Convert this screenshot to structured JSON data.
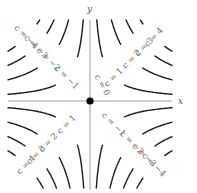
{
  "chart_data": {
    "type": "contour",
    "title": "",
    "function": "c = x*y",
    "xlabel": "x",
    "ylabel": "y",
    "origin_marker": true,
    "levels": [
      {
        "quadrant": "upper-right",
        "values": [
          0,
          1,
          2,
          3,
          4
        ]
      },
      {
        "quadrant": "upper-left",
        "values": [
          -1,
          -2,
          -3,
          -4
        ]
      },
      {
        "quadrant": "lower-left",
        "values": [
          1,
          2,
          3,
          4
        ]
      },
      {
        "quadrant": "lower-right",
        "values": [
          -1,
          -2,
          -3,
          -4
        ]
      }
    ],
    "labels": {
      "upper_right": [
        "c = 0",
        "c = 1",
        "c = 2",
        "c = 3",
        "c = 4"
      ],
      "upper_left": [
        "c = −1",
        "c = −2",
        "c = −3",
        "c = −4"
      ],
      "lower_left": [
        "c = 1",
        "c = 2",
        "c = 3",
        "c = 4"
      ],
      "lower_right": [
        "c = −1",
        "c = −2",
        "c = −3",
        "c = −4"
      ]
    },
    "grid": false,
    "legend": "none"
  },
  "layout": {
    "origin_px": [
      90,
      101
    ],
    "clip": {
      "x0": 8,
      "x1": 172,
      "y0": 20,
      "y1": 188
    },
    "k_px2": [
      550,
      1740,
      2920,
      4080
    ]
  }
}
